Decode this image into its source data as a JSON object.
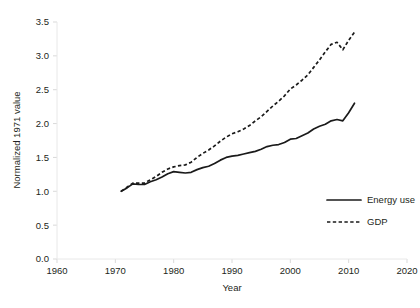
{
  "chart_data": {
    "type": "line",
    "title": "",
    "xlabel": "Year",
    "ylabel": "Normalized 1971 value",
    "xlim": [
      1960,
      2020
    ],
    "ylim": [
      0.0,
      3.5
    ],
    "xticks": [
      1960,
      1970,
      1980,
      1990,
      2000,
      2010,
      2020
    ],
    "xtick_labels": [
      "1960",
      "1970",
      "1980",
      "1990",
      "2000",
      "2010",
      "2020"
    ],
    "yticks": [
      0.0,
      0.5,
      1.0,
      1.5,
      2.0,
      2.5,
      3.0,
      3.5
    ],
    "ytick_labels": [
      "0.0",
      "0.5",
      "1.0",
      "1.5",
      "2.0",
      "2.5",
      "3.0",
      "3.5"
    ],
    "grid": false,
    "legend_position": "lower-right",
    "series": [
      {
        "name": "Energy use",
        "style": "solid",
        "color": "#1a1a1a",
        "x": [
          1971,
          1972,
          1973,
          1974,
          1975,
          1976,
          1977,
          1978,
          1979,
          1980,
          1981,
          1982,
          1983,
          1984,
          1985,
          1986,
          1987,
          1988,
          1989,
          1990,
          1991,
          1992,
          1993,
          1994,
          1995,
          1996,
          1997,
          1998,
          1999,
          2000,
          2001,
          2002,
          2003,
          2004,
          2005,
          2006,
          2007,
          2008,
          2009,
          2010,
          2011
        ],
        "y": [
          1.0,
          1.05,
          1.11,
          1.1,
          1.1,
          1.14,
          1.17,
          1.21,
          1.26,
          1.29,
          1.28,
          1.27,
          1.28,
          1.32,
          1.35,
          1.37,
          1.41,
          1.46,
          1.5,
          1.52,
          1.53,
          1.55,
          1.57,
          1.59,
          1.62,
          1.66,
          1.68,
          1.69,
          1.72,
          1.77,
          1.78,
          1.82,
          1.86,
          1.92,
          1.96,
          1.99,
          2.04,
          2.06,
          2.04,
          2.16,
          2.3
        ]
      },
      {
        "name": "GDP",
        "style": "dashed",
        "color": "#1a1a1a",
        "x": [
          1971,
          1972,
          1973,
          1974,
          1975,
          1976,
          1977,
          1978,
          1979,
          1980,
          1981,
          1982,
          1983,
          1984,
          1985,
          1986,
          1987,
          1988,
          1989,
          1990,
          1991,
          1992,
          1993,
          1994,
          1995,
          1996,
          1997,
          1998,
          1999,
          2000,
          2001,
          2002,
          2003,
          2004,
          2005,
          2006,
          2007,
          2008,
          2009,
          2010,
          2011
        ],
        "y": [
          1.0,
          1.06,
          1.12,
          1.12,
          1.12,
          1.17,
          1.22,
          1.28,
          1.33,
          1.36,
          1.38,
          1.39,
          1.43,
          1.5,
          1.56,
          1.61,
          1.67,
          1.74,
          1.8,
          1.85,
          1.88,
          1.92,
          1.97,
          2.04,
          2.1,
          2.18,
          2.26,
          2.33,
          2.41,
          2.51,
          2.57,
          2.64,
          2.72,
          2.83,
          2.94,
          3.06,
          3.17,
          3.2,
          3.09,
          3.23,
          3.35
        ]
      }
    ],
    "legend": [
      {
        "label": "Energy use",
        "style": "solid"
      },
      {
        "label": "GDP",
        "style": "dashed"
      }
    ]
  }
}
